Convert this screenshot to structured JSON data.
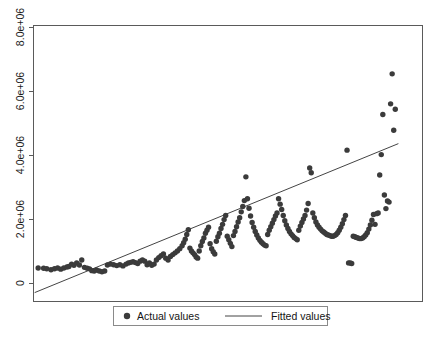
{
  "chart_data": {
    "type": "scatter",
    "title": "",
    "subtitle": "",
    "xlabel": "",
    "ylabel": "",
    "xlim": [
      0,
      100
    ],
    "ylim": [
      -700000,
      8600000
    ],
    "grid": false,
    "y_ticks": [
      0,
      2000000,
      4000000,
      6000000,
      8000000
    ],
    "y_tick_labels": [
      "0",
      "2.0e+06",
      "4.0e+06",
      "6.0e+06",
      "8.0e+06"
    ],
    "y_tick_label_rotation": 90,
    "x_ticks": [],
    "x_tick_labels": [],
    "legend_position": "below-axes",
    "legend": [
      {
        "label": "Actual values",
        "marker": "filled-circle",
        "color": "#3b3b3b"
      },
      {
        "label": "Fitted values",
        "marker": "line",
        "color": "#444444"
      }
    ],
    "series": [
      {
        "name": "Actual values",
        "type": "scatter",
        "marker": "filled-circle",
        "color": "#3b3b3b",
        "points": [
          [
            1.2,
            430000
          ],
          [
            2.6,
            420000
          ],
          [
            3.4,
            405000
          ],
          [
            4.5,
            370000
          ],
          [
            5.4,
            405000
          ],
          [
            6.2,
            430000
          ],
          [
            7.0,
            390000
          ],
          [
            7.8,
            430000
          ],
          [
            8.6,
            460000
          ],
          [
            9.1,
            480000
          ],
          [
            9.8,
            560000
          ],
          [
            10.4,
            520000
          ],
          [
            11.1,
            600000
          ],
          [
            11.8,
            530000
          ],
          [
            12.4,
            700000
          ],
          [
            13.1,
            450000
          ],
          [
            13.8,
            420000
          ],
          [
            14.4,
            400000
          ],
          [
            15.0,
            340000
          ],
          [
            15.6,
            330000
          ],
          [
            16.2,
            360000
          ],
          [
            16.9,
            330000
          ],
          [
            17.6,
            300000
          ],
          [
            18.3,
            330000
          ],
          [
            19.0,
            530000
          ],
          [
            19.8,
            560000
          ],
          [
            20.6,
            540000
          ],
          [
            21.4,
            510000
          ],
          [
            22.2,
            540000
          ],
          [
            23.0,
            500000
          ],
          [
            23.8,
            560000
          ],
          [
            24.4,
            600000
          ],
          [
            25.0,
            620000
          ],
          [
            25.6,
            640000
          ],
          [
            26.2,
            610000
          ],
          [
            26.8,
            580000
          ],
          [
            27.4,
            660000
          ],
          [
            28.0,
            700000
          ],
          [
            28.6,
            660000
          ],
          [
            29.2,
            540000
          ],
          [
            29.8,
            600000
          ],
          [
            30.4,
            520000
          ],
          [
            31.0,
            560000
          ],
          [
            31.6,
            700000
          ],
          [
            32.2,
            780000
          ],
          [
            32.8,
            840000
          ],
          [
            33.4,
            900000
          ],
          [
            34.0,
            760000
          ],
          [
            34.6,
            700000
          ],
          [
            35.2,
            820000
          ],
          [
            35.8,
            880000
          ],
          [
            36.4,
            940000
          ],
          [
            37.0,
            1000000
          ],
          [
            37.6,
            1080000
          ],
          [
            38.2,
            1180000
          ],
          [
            38.6,
            1280000
          ],
          [
            39.0,
            1400000
          ],
          [
            39.4,
            1560000
          ],
          [
            39.8,
            1720000
          ],
          [
            40.2,
            1100000
          ],
          [
            40.6,
            1000000
          ],
          [
            41.0,
            940000
          ],
          [
            41.4,
            880000
          ],
          [
            41.8,
            800000
          ],
          [
            42.2,
            760000
          ],
          [
            42.6,
            1000000
          ],
          [
            43.0,
            1180000
          ],
          [
            43.4,
            1320000
          ],
          [
            43.8,
            1440000
          ],
          [
            44.2,
            1600000
          ],
          [
            44.6,
            1700000
          ],
          [
            45.0,
            1800000
          ],
          [
            45.4,
            1250000
          ],
          [
            45.8,
            1080000
          ],
          [
            46.2,
            980000
          ],
          [
            46.6,
            900000
          ],
          [
            47.0,
            1330000
          ],
          [
            47.4,
            1480000
          ],
          [
            47.8,
            1600000
          ],
          [
            48.2,
            1760000
          ],
          [
            48.6,
            1900000
          ],
          [
            49.0,
            2060000
          ],
          [
            49.4,
            2200000
          ],
          [
            49.8,
            1500000
          ],
          [
            50.2,
            1380000
          ],
          [
            50.6,
            1260000
          ],
          [
            51.0,
            1150000
          ],
          [
            51.4,
            1520000
          ],
          [
            51.8,
            1660000
          ],
          [
            52.2,
            1820000
          ],
          [
            52.6,
            1980000
          ],
          [
            53.0,
            2120000
          ],
          [
            53.4,
            2320000
          ],
          [
            53.8,
            2500000
          ],
          [
            54.2,
            2700000
          ],
          [
            54.6,
            3500000
          ],
          [
            55.0,
            2760000
          ],
          [
            55.4,
            2440000
          ],
          [
            55.8,
            2180000
          ],
          [
            56.2,
            1960000
          ],
          [
            56.6,
            1800000
          ],
          [
            57.0,
            1660000
          ],
          [
            57.4,
            1540000
          ],
          [
            57.8,
            1440000
          ],
          [
            58.2,
            1360000
          ],
          [
            58.6,
            1300000
          ],
          [
            59.0,
            1250000
          ],
          [
            59.4,
            1200000
          ],
          [
            59.8,
            1180000
          ],
          [
            60.2,
            1560000
          ],
          [
            60.6,
            1700000
          ],
          [
            61.0,
            1820000
          ],
          [
            61.4,
            1940000
          ],
          [
            61.8,
            2060000
          ],
          [
            62.2,
            2180000
          ],
          [
            62.6,
            2280000
          ],
          [
            63.0,
            2760000
          ],
          [
            63.4,
            2580000
          ],
          [
            63.8,
            2400000
          ],
          [
            64.2,
            2200000
          ],
          [
            64.6,
            2020000
          ],
          [
            65.0,
            1880000
          ],
          [
            65.4,
            1760000
          ],
          [
            65.8,
            1660000
          ],
          [
            66.2,
            1580000
          ],
          [
            66.6,
            1520000
          ],
          [
            67.0,
            1460000
          ],
          [
            67.4,
            1420000
          ],
          [
            67.8,
            1380000
          ],
          [
            68.2,
            1700000
          ],
          [
            68.6,
            1840000
          ],
          [
            69.0,
            1960000
          ],
          [
            69.4,
            2080000
          ],
          [
            69.8,
            2200000
          ],
          [
            70.2,
            2380000
          ],
          [
            70.6,
            2600000
          ],
          [
            71.0,
            3800000
          ],
          [
            71.4,
            3640000
          ],
          [
            71.8,
            2280000
          ],
          [
            72.2,
            2120000
          ],
          [
            72.6,
            1980000
          ],
          [
            73.0,
            1880000
          ],
          [
            73.4,
            1800000
          ],
          [
            73.8,
            1740000
          ],
          [
            74.2,
            1680000
          ],
          [
            74.6,
            1640000
          ],
          [
            75.0,
            1600000
          ],
          [
            75.4,
            1560000
          ],
          [
            75.8,
            1540000
          ],
          [
            76.2,
            1520000
          ],
          [
            76.6,
            1500000
          ],
          [
            77.0,
            1500000
          ],
          [
            77.4,
            1520000
          ],
          [
            77.8,
            1560000
          ],
          [
            78.2,
            1620000
          ],
          [
            78.6,
            1700000
          ],
          [
            79.0,
            1800000
          ],
          [
            79.4,
            1920000
          ],
          [
            79.8,
            2060000
          ],
          [
            80.2,
            2200000
          ],
          [
            80.6,
            4400000
          ],
          [
            81.0,
            600000
          ],
          [
            81.4,
            600000
          ],
          [
            81.8,
            580000
          ],
          [
            82.2,
            1500000
          ],
          [
            82.6,
            1480000
          ],
          [
            83.0,
            1460000
          ],
          [
            83.4,
            1440000
          ],
          [
            83.8,
            1420000
          ],
          [
            84.2,
            1420000
          ],
          [
            84.6,
            1440000
          ],
          [
            85.0,
            1480000
          ],
          [
            85.4,
            1540000
          ],
          [
            85.8,
            1620000
          ],
          [
            86.2,
            1740000
          ],
          [
            86.6,
            1880000
          ],
          [
            87.0,
            2040000
          ],
          [
            87.4,
            2230000
          ],
          [
            87.8,
            1900000
          ],
          [
            88.2,
            2260000
          ],
          [
            88.6,
            2280000
          ],
          [
            89.0,
            3560000
          ],
          [
            89.4,
            4250000
          ],
          [
            89.8,
            5600000
          ],
          [
            90.2,
            2890000
          ],
          [
            90.6,
            2430000
          ],
          [
            91.0,
            2690000
          ],
          [
            91.4,
            2650000
          ],
          [
            91.8,
            5960000
          ],
          [
            92.2,
            6970000
          ],
          [
            92.6,
            5070000
          ],
          [
            93.0,
            5780000
          ]
        ]
      }
    ],
    "fit_line": {
      "name": "Fitted values",
      "type": "line",
      "color": "#444444",
      "endpoints": [
        [
          0.3,
          -400000
        ],
        [
          93.8,
          4620000
        ]
      ]
    }
  },
  "legend_entries": {
    "actual": "Actual values",
    "fitted": "Fitted values"
  },
  "caption": ""
}
